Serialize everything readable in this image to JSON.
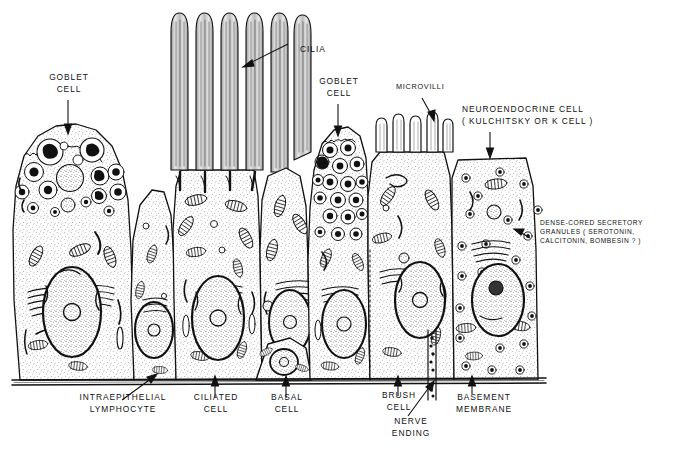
{
  "figure": {
    "background_color": "#ffffff",
    "ink_color": "#111111"
  },
  "labels": {
    "goblet_cell_left": "GOBLET\nCELL",
    "cilia": "CILIA",
    "goblet_cell_right": "GOBLET\nCELL",
    "microvilli": "MICROVILLI",
    "neuroendocrine_cell": "NEUROENDOCRINE CELL\n( KULCHITSKY OR K CELL )",
    "dense_cored_granules": "DENSE-CORED SECRETORY\nGRANULES ( SEROTONIN,\nCALCITONIN, BOMBESIN ? )",
    "intraepithelial_lymphocyte": "INTRAEPITHELIAL\nLYMPHOCYTE",
    "ciliated_cell": "CILIATED\nCELL",
    "basal_cell": "BASAL\nCELL",
    "brush_cell": "BRUSH\nCELL",
    "nerve_ending": "NERVE\nENDING",
    "basement_membrane": "BASEMENT\nMEMBRANE"
  },
  "structures": {
    "goblet_cell_left": "goblet-cell-left",
    "ciliated_cell": "ciliated-cell",
    "goblet_cell_right": "goblet-cell-right",
    "brush_cell": "brush-cell",
    "neuroendocrine_cell": "neuroendocrine-cell",
    "basal_cell": "basal-cell",
    "intraepithelial_lymphocyte": "intraepithelial-lymphocyte",
    "basement_membrane": "basement-membrane",
    "nerve_ending": "nerve-ending",
    "cilia_count": 6,
    "microvilli_count": 6
  }
}
